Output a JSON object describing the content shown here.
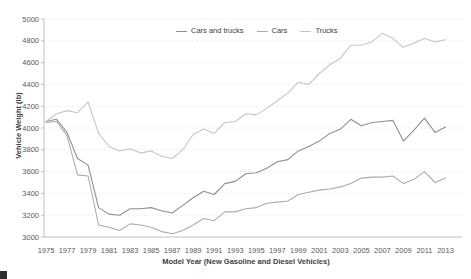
{
  "chart_data": {
    "type": "line",
    "title": "",
    "xlabel": "Model Year (New Gasoline and Diesel Vehicles)",
    "ylabel": "Vehicle Weight (lb)",
    "x": [
      1975,
      1976,
      1977,
      1978,
      1979,
      1980,
      1981,
      1982,
      1983,
      1984,
      1985,
      1986,
      1987,
      1988,
      1989,
      1990,
      1991,
      1992,
      1993,
      1994,
      1995,
      1996,
      1997,
      1998,
      1999,
      2000,
      2001,
      2002,
      2003,
      2004,
      2005,
      2006,
      2007,
      2008,
      2009,
      2010,
      2011,
      2012,
      2013
    ],
    "x_tick_labels": [
      "1975",
      "1977",
      "1979",
      "1981",
      "1983",
      "1985",
      "1987",
      "1989",
      "1991",
      "1993",
      "1995",
      "1997",
      "1999",
      "2001",
      "2003",
      "2005",
      "2007",
      "2009",
      "2011",
      "2013"
    ],
    "ylim": [
      3000,
      5000
    ],
    "y_ticks": [
      3000,
      3200,
      3400,
      3600,
      3800,
      4000,
      4200,
      4400,
      4600,
      4800,
      5000
    ],
    "grid": "horizontal-dashed",
    "legend_position": "top-center",
    "series": [
      {
        "name": "Cars and trucks",
        "color": "#8f8f8f",
        "values": [
          4060,
          4080,
          3960,
          3720,
          3660,
          3270,
          3210,
          3200,
          3260,
          3260,
          3270,
          3240,
          3220,
          3290,
          3360,
          3420,
          3390,
          3490,
          3510,
          3580,
          3590,
          3630,
          3690,
          3710,
          3790,
          3830,
          3880,
          3950,
          3990,
          4080,
          4020,
          4050,
          4060,
          4070,
          3880,
          3980,
          4090,
          3960,
          4010
        ]
      },
      {
        "name": "Cars",
        "color": "#acacac",
        "values": [
          4050,
          4060,
          3930,
          3570,
          3560,
          3110,
          3090,
          3060,
          3120,
          3110,
          3090,
          3050,
          3030,
          3060,
          3110,
          3170,
          3150,
          3230,
          3230,
          3260,
          3270,
          3310,
          3320,
          3330,
          3390,
          3410,
          3430,
          3440,
          3460,
          3490,
          3540,
          3550,
          3550,
          3560,
          3490,
          3530,
          3600,
          3500,
          3540
        ]
      },
      {
        "name": "Trucks",
        "color": "#c6c6c6",
        "values": [
          4060,
          4130,
          4160,
          4140,
          4240,
          3950,
          3830,
          3790,
          3810,
          3770,
          3790,
          3740,
          3720,
          3800,
          3940,
          3990,
          3950,
          4050,
          4060,
          4130,
          4120,
          4180,
          4250,
          4320,
          4420,
          4400,
          4500,
          4580,
          4640,
          4760,
          4760,
          4790,
          4870,
          4820,
          4740,
          4780,
          4820,
          4790,
          4810
        ]
      }
    ],
    "axis_colors": {
      "tick_text": "#595959",
      "axis_line": "#bfbfbf",
      "gridline": "#e7e7e7"
    }
  }
}
